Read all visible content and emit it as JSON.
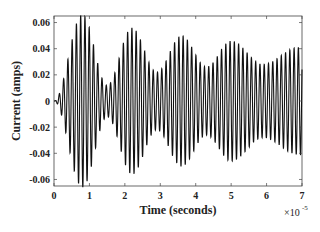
{
  "chart_data": {
    "type": "line",
    "title": "",
    "xlabel": "Time (seconds)",
    "ylabel": "Current (amps)",
    "x_scale_note": "×10^-5",
    "xlim": [
      0,
      7
    ],
    "ylim": [
      -0.065,
      0.065
    ],
    "xticks": [
      0,
      1,
      2,
      3,
      4,
      5,
      6,
      7
    ],
    "yticks": [
      -0.06,
      -0.04,
      -0.02,
      0,
      0.02,
      0.04,
      0.06
    ],
    "ytick_labels": [
      "-0.06",
      "-0.04",
      "-0.02",
      "0",
      "0.02",
      "0.04",
      "0.06"
    ],
    "grid": false,
    "series": [
      {
        "name": "current",
        "description": "High-frequency oscillation with beating envelope; approx 8.3 cycles per 1e-5 s",
        "envelope_peaks": [
          {
            "x": 0.8,
            "y": 0.066
          },
          {
            "x": 2.2,
            "y": 0.056
          },
          {
            "x": 3.6,
            "y": 0.05
          },
          {
            "x": 5.0,
            "y": 0.046
          },
          {
            "x": 6.9,
            "y": 0.041
          }
        ],
        "envelope_troughs": [
          {
            "x": 0.0,
            "y": 0.0
          },
          {
            "x": 1.5,
            "y": 0.012
          },
          {
            "x": 2.9,
            "y": 0.022
          },
          {
            "x": 4.3,
            "y": 0.026
          },
          {
            "x": 5.9,
            "y": 0.028
          }
        ]
      }
    ]
  }
}
